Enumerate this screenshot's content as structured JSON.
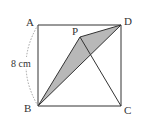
{
  "diagram": {
    "type": "geometry-square",
    "colors": {
      "stroke": "#333333",
      "shade": "#b8b8b8",
      "arc": "#888888",
      "background": "#ffffff"
    },
    "points": {
      "A": {
        "label": "A",
        "x": 38,
        "y": 25
      },
      "B": {
        "label": "B",
        "x": 38,
        "y": 106
      },
      "C": {
        "label": "C",
        "x": 121,
        "y": 106
      },
      "D": {
        "label": "D",
        "x": 121,
        "y": 25
      },
      "P": {
        "label": "P",
        "x": 80,
        "y": 37
      }
    },
    "segments": [
      [
        "A",
        "D"
      ],
      [
        "D",
        "C"
      ],
      [
        "C",
        "B"
      ],
      [
        "B",
        "A"
      ],
      [
        "B",
        "D"
      ],
      [
        "B",
        "P"
      ],
      [
        "P",
        "D"
      ],
      [
        "P",
        "C"
      ]
    ],
    "shaded_region": [
      "B",
      "P",
      "D"
    ],
    "dimension": {
      "label": "8 cm",
      "between": [
        "A",
        "B"
      ],
      "style": "dashed-arc"
    }
  }
}
